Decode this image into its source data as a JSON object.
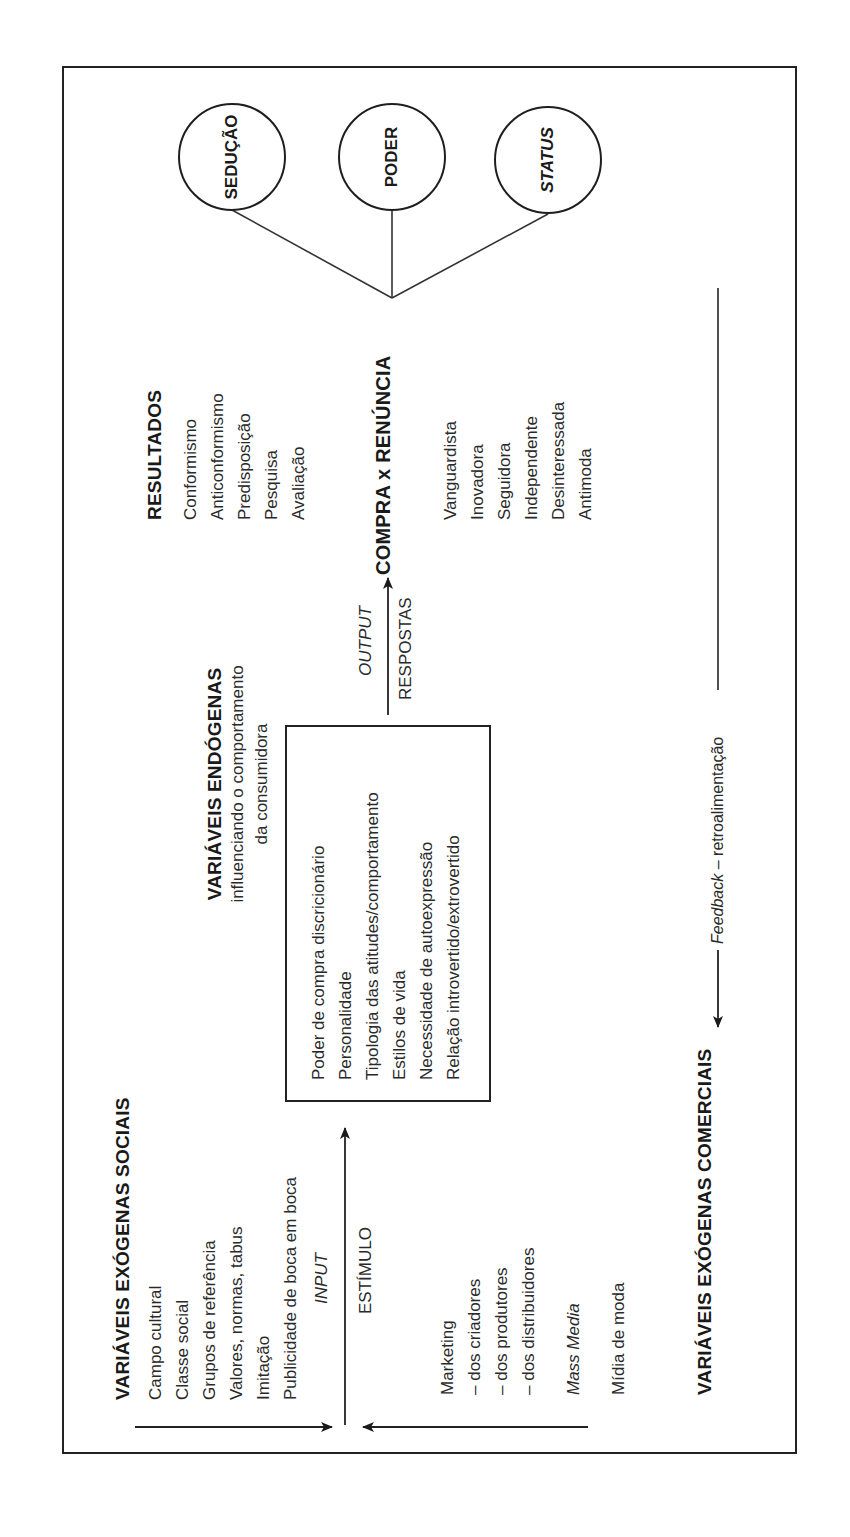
{
  "outcomes": {
    "circles": [
      {
        "label": "SEDUÇÃO",
        "italic": false
      },
      {
        "label": "PODER",
        "italic": false
      },
      {
        "label": "STATUS",
        "italic": true
      }
    ]
  },
  "resultados": {
    "title": "RESULTADOS",
    "items": [
      "Conformismo",
      "Anticonformismo",
      "Predisposição",
      "Pesquisa",
      "Avaliação"
    ]
  },
  "decision": {
    "title": "COMPRA x RENÚNCIA",
    "consumer_types": [
      "Vanguardista",
      "Inovadora",
      "Seguidora",
      "Independente",
      "Desinteressada",
      "Antimoda"
    ]
  },
  "output_arrow": {
    "label_italic": "OUTPUT",
    "label": "RESPOSTAS"
  },
  "endogenas": {
    "title": "VARIÁVEIS ENDÓGENAS",
    "subtitle_line1": "influenciando o comportamento",
    "subtitle_line2": "da consumidora",
    "items": [
      "Poder de compra discricionário",
      "Personalidade",
      "Tipologia das atitudes/comportamento",
      "Estilos de vida",
      "Necessidade de autoexpressão",
      "Relação introvertido/extrovertido"
    ]
  },
  "input_arrow": {
    "label_italic": "INPUT",
    "label": "ESTÍMULO"
  },
  "exogenas_sociais": {
    "title": "VARIÁVEIS EXÓGENAS SOCIAIS",
    "items": [
      "Campo cultural",
      "Classe social",
      "Grupos de referência",
      "Valores, normas, tabus",
      "Imitação",
      "Publicidade de boca em boca"
    ]
  },
  "exogenas_comerciais": {
    "title": "VARIÁVEIS EXÓGENAS COMERCIAIS",
    "marketing": "Marketing",
    "marketing_sub": [
      "– dos criadores",
      "– dos produtores",
      "– dos distribuidores"
    ],
    "mass_media": "Mass Media",
    "midia": "Mídia de moda"
  },
  "feedback": {
    "label_italic": "Feedback",
    "label_rest": " – retroalimentação"
  }
}
